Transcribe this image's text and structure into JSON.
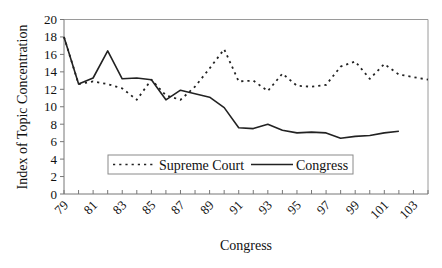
{
  "chart_data": {
    "type": "line",
    "title": "",
    "xlabel": "Congress",
    "ylabel": "Index of Topic Concentration",
    "ylim": [
      0,
      20
    ],
    "yticks": [
      0,
      2,
      4,
      6,
      8,
      10,
      12,
      14,
      16,
      18,
      20
    ],
    "x": [
      79,
      80,
      81,
      82,
      83,
      84,
      85,
      86,
      87,
      88,
      89,
      90,
      91,
      92,
      93,
      94,
      95,
      96,
      97,
      98,
      99,
      100,
      101,
      102,
      103,
      104
    ],
    "xtick_labels": [
      "79",
      "81",
      "83",
      "85",
      "87",
      "89",
      "91",
      "93",
      "95",
      "97",
      "99",
      "101",
      "103"
    ],
    "grid": false,
    "legend_position": "lower center (inside plot)",
    "series": [
      {
        "name": "Supreme Court",
        "style": "dotted",
        "values": [
          18.0,
          12.6,
          12.9,
          12.6,
          12.1,
          10.8,
          13.1,
          11.3,
          10.8,
          12.3,
          14.4,
          16.6,
          12.9,
          13.0,
          11.8,
          13.8,
          12.4,
          12.3,
          12.5,
          14.6,
          15.2,
          13.2,
          14.9,
          13.7,
          13.4,
          13.1
        ]
      },
      {
        "name": "Congress",
        "style": "solid",
        "values": [
          18.0,
          12.6,
          13.3,
          16.4,
          13.2,
          13.3,
          13.1,
          10.8,
          11.9,
          11.5,
          11.1,
          9.9,
          7.6,
          7.5,
          8.0,
          7.3,
          7.0,
          7.1,
          7.0,
          6.4,
          6.6,
          6.7,
          7.0,
          7.2,
          null,
          null
        ]
      }
    ]
  },
  "legend": {
    "supreme_court_label": "Supreme Court",
    "congress_label": "Congress"
  },
  "axes": {
    "x_title": "Congress",
    "y_title": "Index of Topic Concentration"
  }
}
